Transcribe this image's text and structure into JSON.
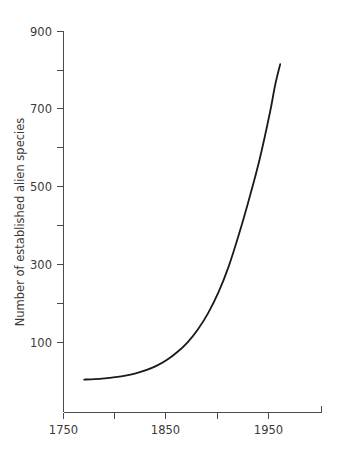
{
  "chart_data": {
    "type": "line",
    "title": "",
    "subtitle": "",
    "xlabel": "",
    "ylabel": "Number of established alien species",
    "xlim": [
      1750,
      2000
    ],
    "ylim": [
      0,
      900
    ],
    "grid": false,
    "legend": null,
    "x_major_ticks": [
      1750,
      1850,
      1950
    ],
    "x_minor_ticks": [
      1800,
      1900,
      2000
    ],
    "x_tick_labels": [
      "1750",
      "1850",
      "1950"
    ],
    "y_major_ticks": [
      100,
      300,
      500,
      700,
      900
    ],
    "y_minor_ticks": [
      200,
      400,
      600,
      800
    ],
    "y_tick_labels": [
      "100",
      "300",
      "500",
      "700",
      "900"
    ],
    "series": [
      {
        "name": "Established alien species",
        "color": "#1a1a1a",
        "x": [
          1770,
          1780,
          1790,
          1800,
          1810,
          1820,
          1830,
          1840,
          1850,
          1860,
          1870,
          1880,
          1890,
          1900,
          1910,
          1920,
          1930,
          1940,
          1950,
          1955,
          1960
        ],
        "y": [
          5,
          6,
          8,
          11,
          15,
          21,
          29,
          40,
          55,
          75,
          100,
          133,
          175,
          228,
          295,
          378,
          470,
          570,
          690,
          760,
          815
        ]
      }
    ]
  },
  "axis_titles": {
    "y": "Number of established alien species"
  },
  "labels": {
    "y_900": "900",
    "y_700": "700",
    "y_500": "500",
    "y_300": "300",
    "y_100": "100",
    "x_1750": "1750",
    "x_1850": "1850",
    "x_1950": "1950"
  },
  "colors": {
    "background": "#ffffff",
    "axis": "#4a4a4a",
    "curve": "#1a1a1a",
    "text": "#3a3a3a"
  }
}
